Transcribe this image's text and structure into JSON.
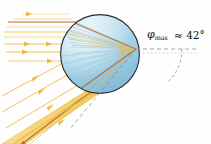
{
  "figure": {
    "background_color": "#fefefe"
  },
  "annotations": {
    "angle_symbol": "φ",
    "angle_subscript": "max",
    "angle_value": "≈ 42°",
    "angle_full": "φmax ≈ 42°"
  },
  "droplet": {
    "name": "water-droplet",
    "cx": 100,
    "cy": 54,
    "r": 40,
    "fill_top": "#bfe0ef",
    "fill_bottom": "#8fc3de",
    "highlight": "#e8f4fa",
    "outline": "#2b2b2b"
  },
  "colors": {
    "ray_yellow": "#f2c14a",
    "ray_pale": "#f7e3a8",
    "ray_red": "#c1602c",
    "beam_band": "#f3cf6a",
    "beam_band_edge": "#e0ad33",
    "internal_ray": "#a8cfe0",
    "dashed_line": "#8a8a8a",
    "text": "#111111"
  },
  "incoming_rays": {
    "name": "incident-sunlight-rays",
    "count": 9,
    "direction": "left-to-right",
    "y_positions": [
      14,
      19,
      22,
      27,
      32,
      37,
      44,
      52,
      61
    ],
    "highlight_index": 2,
    "arrow_marker": "triangle"
  },
  "slanted_rays": {
    "name": "lower-incident-rays",
    "count": 4
  },
  "exit_beam": {
    "name": "exit-beam-band",
    "description": "concentrated outgoing beam at rainbow angle",
    "direction": "down-left"
  },
  "angle_arc": {
    "name": "angle-arc",
    "from": "horizontal-dashed-axis",
    "to": "slanted-dashed-axis"
  }
}
